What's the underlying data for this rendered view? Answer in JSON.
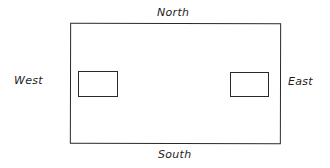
{
  "diagram": {
    "labels": {
      "north": "North",
      "south": "South",
      "west": "West",
      "east": "East"
    },
    "colors": {
      "line": "#2a2a2a",
      "text": "#1e1e1e",
      "background": "#ffffff"
    },
    "shapes": {
      "outer": {
        "x": 70,
        "y": 23,
        "width": 210,
        "height": 120
      },
      "inner_left": {
        "x": 78,
        "y": 71,
        "width": 40,
        "height": 26
      },
      "inner_right": {
        "x": 230,
        "y": 72,
        "width": 39,
        "height": 25
      }
    }
  }
}
